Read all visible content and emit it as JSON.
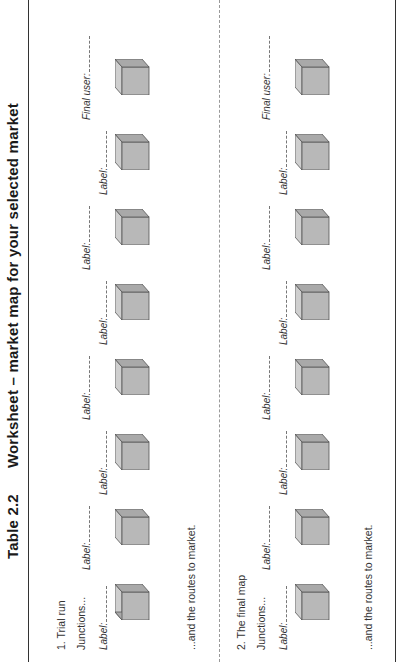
{
  "title": {
    "number": "Table 2.2",
    "text": "Worksheet – market map for your selected market"
  },
  "sections": [
    {
      "heading": "1. Trial run",
      "junctions_label": "Junctions...",
      "routes_text": "...and the routes to market.",
      "labels": [
        "Label:",
        "Label:",
        "Label:",
        "Label:",
        "Label:",
        "Label:",
        "Label:",
        "Final user:"
      ]
    },
    {
      "heading": "2. The final map",
      "junctions_label": "Junctions...",
      "routes_text": "...and the routes to market.",
      "labels": [
        "Label:",
        "Label:",
        "Label:",
        "Label:",
        "Label:",
        "Label:",
        "Label:",
        "Final user:"
      ]
    }
  ],
  "cube_count_per_section": 8,
  "colors": {
    "cube_front": "#b8b8b8",
    "cube_top": "#cfcfcf",
    "cube_side": "#a9a9a9",
    "cube_edge": "#555555",
    "rule": "#333333"
  }
}
